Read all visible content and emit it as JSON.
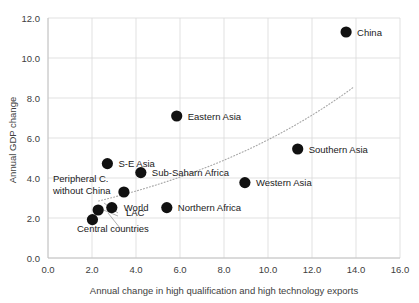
{
  "chart_data": {
    "type": "scatter",
    "title": "",
    "xlabel": "Annual change in high qualification and high technology exports",
    "ylabel": "Annual GDP change",
    "xlim": [
      0.0,
      16.0
    ],
    "ylim": [
      0.0,
      12.0
    ],
    "xticks": [
      "0.0",
      "2.0",
      "4.0",
      "6.0",
      "8.0",
      "10.0",
      "12.0",
      "14.0",
      "16.0"
    ],
    "yticks": [
      "0.0",
      "2.0",
      "4.0",
      "6.0",
      "8.0",
      "10.0",
      "12.0"
    ],
    "grid": true,
    "legend": "none",
    "marker_color": "#111111",
    "trendline": {
      "style": "dotted",
      "color": "#a6a6a6",
      "type": "exponential",
      "x_start": 2.3,
      "y_start": 2.85,
      "x_end": 13.9,
      "y_end": 8.55
    },
    "points": [
      {
        "label": "China",
        "x": 13.55,
        "y": 11.3,
        "label_dx": 11,
        "label_dy": 3.5,
        "anchor": "start"
      },
      {
        "label": "Eastern Asia",
        "x": 5.85,
        "y": 7.1,
        "label_dx": 11,
        "label_dy": 3.5,
        "anchor": "start"
      },
      {
        "label": "Southern Asia",
        "x": 11.35,
        "y": 5.45,
        "label_dx": 11,
        "label_dy": 3.5,
        "anchor": "start"
      },
      {
        "label": "S-E Asia",
        "x": 2.7,
        "y": 4.72,
        "label_dx": 11,
        "label_dy": 3.5,
        "anchor": "start"
      },
      {
        "label": "Sub-Saharn Africa",
        "x": 4.22,
        "y": 4.27,
        "label_dx": 11,
        "label_dy": 3.5,
        "anchor": "start"
      },
      {
        "label": "Western Asia",
        "x": 8.95,
        "y": 3.77,
        "label_dx": 11,
        "label_dy": 3.5,
        "anchor": "start"
      },
      {
        "label": "Peripheral C. without China",
        "x": 3.45,
        "y": 3.3,
        "label_dx": 0,
        "label_dy": 0,
        "anchor": "custom"
      },
      {
        "label": "World",
        "x": 2.9,
        "y": 2.52,
        "label_dx": 12,
        "label_dy": 3.5,
        "anchor": "start"
      },
      {
        "label": "Northern Africa",
        "x": 5.4,
        "y": 2.52,
        "label_dx": 11,
        "label_dy": 3.5,
        "anchor": "start"
      },
      {
        "label": "LAC",
        "x": 2.28,
        "y": 2.4,
        "label_dx": 0,
        "label_dy": 0,
        "anchor": "custom"
      },
      {
        "label": "Central countries",
        "x": 2.02,
        "y": 1.92,
        "label_dx": 0,
        "label_dy": 0,
        "anchor": "custom"
      }
    ],
    "extra_labels": [
      {
        "name": "peripheral-line1",
        "text": "Peripheral C.",
        "x": 53,
        "y": 182
      },
      {
        "name": "peripheral-line2",
        "text": "without China",
        "x": 53,
        "y": 194
      },
      {
        "name": "lac-label",
        "text": "LAC",
        "x": 126,
        "y": 216
      },
      {
        "name": "central-label",
        "text": "Central countries",
        "x": 77,
        "y": 232
      }
    ]
  }
}
